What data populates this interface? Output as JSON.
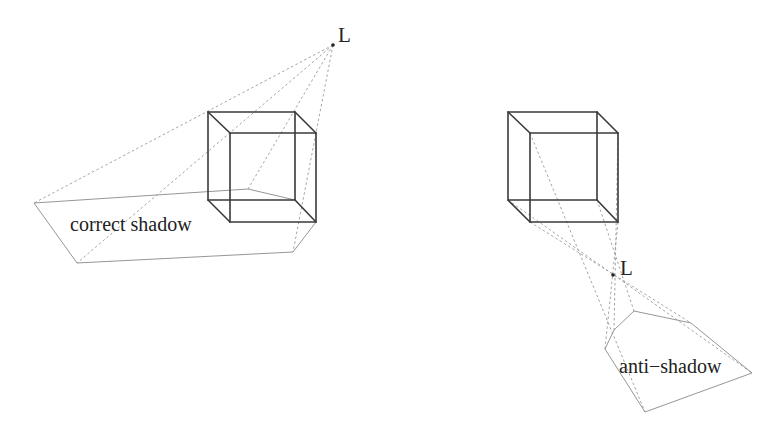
{
  "figure": {
    "left_panel": {
      "light_label": "L",
      "region_label": "correct shadow",
      "light": [
        333,
        45
      ],
      "cube": {
        "back": [
          [
            208,
            112
          ],
          [
            295,
            112
          ],
          [
            295,
            200
          ],
          [
            208,
            200
          ]
        ],
        "front": [
          [
            230,
            133
          ],
          [
            316,
            133
          ],
          [
            316,
            222
          ],
          [
            230,
            222
          ]
        ]
      },
      "shadow_polygon": [
        [
          34,
          203
        ],
        [
          248,
          189
        ],
        [
          295,
          200
        ]
      ],
      "shadow_polygon_lower": [
        [
          316,
          222
        ],
        [
          293,
          252
        ],
        [
          77,
          263
        ],
        [
          34,
          203
        ]
      ],
      "rays": [
        [
          [
            333,
            45
          ],
          [
            34,
            203
          ]
        ],
        [
          [
            333,
            45
          ],
          [
            77,
            263
          ]
        ],
        [
          [
            333,
            45
          ],
          [
            248,
            189
          ]
        ],
        [
          [
            333,
            45
          ],
          [
            293,
            252
          ]
        ]
      ]
    },
    "right_panel": {
      "light_label": "L",
      "region_label": "anti−shadow",
      "light": [
        613,
        275
      ],
      "cube": {
        "back": [
          [
            508,
            112
          ],
          [
            597,
            112
          ],
          [
            597,
            200
          ],
          [
            508,
            200
          ]
        ],
        "front": [
          [
            530,
            133
          ],
          [
            618,
            133
          ],
          [
            618,
            222
          ],
          [
            530,
            222
          ]
        ]
      },
      "anti_shadow_polygon": [
        [
          605,
          349
        ],
        [
          614,
          330
        ],
        [
          634,
          311
        ],
        [
          691,
          323
        ],
        [
          752,
          373
        ],
        [
          645,
          412
        ]
      ],
      "rays": [
        [
          [
            530,
            133
          ],
          [
            645,
            412
          ]
        ],
        [
          [
            508,
            200
          ],
          [
            752,
            373
          ]
        ],
        [
          [
            530,
            222
          ],
          [
            691,
            323
          ]
        ],
        [
          [
            597,
            200
          ],
          [
            634,
            311
          ]
        ],
        [
          [
            618,
            222
          ],
          [
            605,
            349
          ]
        ],
        [
          [
            618,
            133
          ],
          [
            614,
            330
          ]
        ]
      ]
    }
  }
}
